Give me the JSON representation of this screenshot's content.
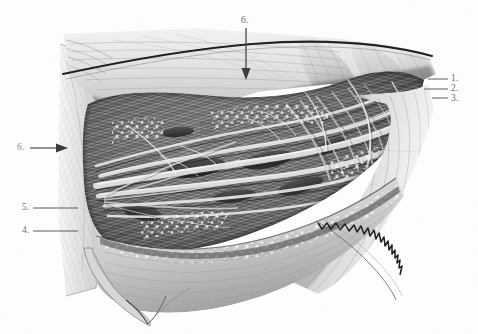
{
  "plate": {
    "title": "Surgical dissection plate",
    "medium": "graphite pencil illustration",
    "background_color": "#ffffff",
    "ink_color": "#3c3c3c",
    "label_color": "#6d6d6d",
    "width": 478,
    "height": 334
  },
  "labels": {
    "right": [
      {
        "id": "label-1",
        "text": "1.",
        "x": 451,
        "y": 74
      },
      {
        "id": "label-2",
        "text": "2.",
        "x": 451,
        "y": 84
      },
      {
        "id": "label-3",
        "text": "3.",
        "x": 451,
        "y": 94
      }
    ],
    "left": [
      {
        "id": "label-6-left",
        "text": "6.",
        "x": 17,
        "y": 143
      },
      {
        "id": "label-5-left",
        "text": "5.",
        "x": 22,
        "y": 203
      },
      {
        "id": "label-4-left",
        "text": "4.",
        "x": 22,
        "y": 226
      }
    ],
    "top": [
      {
        "id": "label-6-top",
        "text": "6.",
        "x": 241,
        "y": 16
      }
    ]
  },
  "leaders": {
    "right": [
      {
        "for": "1.",
        "x": 428,
        "y": 79,
        "length": 20
      },
      {
        "for": "2.",
        "x": 424,
        "y": 89,
        "length": 24
      },
      {
        "for": "3.",
        "x": 432,
        "y": 98,
        "length": 16
      }
    ],
    "left": [
      {
        "for": "5.",
        "x": 33,
        "y": 208,
        "length": 45
      },
      {
        "for": "4.",
        "x": 33,
        "y": 231,
        "length": 45
      }
    ],
    "arrows": [
      {
        "for": "6.",
        "orientation": "horizontal",
        "x": 30,
        "y": 148,
        "length": 38,
        "points": "right"
      },
      {
        "for": "6.",
        "orientation": "vertical",
        "x": 246,
        "y": 28,
        "length": 50,
        "points": "down"
      }
    ]
  },
  "figure_regions": [
    {
      "name": "upper-retracted-flap",
      "description": "Upper skin and fascia flap retracted superiorly with sharp incised edge"
    },
    {
      "name": "incision-edge",
      "description": "Dark sharp cut line along upper-left flap margin"
    },
    {
      "name": "left-skin-flap",
      "description": "Vertical retracted skin flap on the left margin"
    },
    {
      "name": "dissection-field",
      "description": "Central fibrous and muscular strands with dense crosshatching"
    },
    {
      "name": "fat-lobules",
      "description": "Stippled subcutaneous fat lobules along cut edges"
    },
    {
      "name": "lower-flap",
      "description": "Lower retracted flap folding downward with pointed apex"
    },
    {
      "name": "serrated-edge",
      "description": "Zigzag serrated cut fascial edge at lower right"
    },
    {
      "name": "right-flap",
      "description": "Right tissue flap fading toward the right margin"
    }
  ]
}
